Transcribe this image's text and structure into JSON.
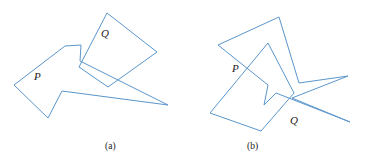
{
  "figure": {
    "background_color": "#ffffff",
    "stroke_color": "#5b96cc",
    "label_color": "#1a1a1a",
    "panels": [
      {
        "id": "a",
        "caption": "(a)",
        "caption_x": 105,
        "caption_y": 149,
        "shapes": [
          {
            "name": "polygon-p",
            "label": "P",
            "label_x": 34,
            "label_y": 80,
            "points": "14,85 65,46 81,45 80,61 168,105 62,91 48,118"
          },
          {
            "name": "polygon-q",
            "label": "Q",
            "label_x": 101,
            "label_y": 37,
            "points": "107,13 157,52 108,87 79,67"
          }
        ]
      },
      {
        "id": "b",
        "caption": "(b)",
        "caption_x": 247,
        "caption_y": 149,
        "shapes": [
          {
            "name": "polygon-p",
            "label": "P",
            "label_x": 232,
            "label_y": 72,
            "points": "279,17 299,83 348,76 292,98 350,122 276,93 264,105 268,85 218,45"
          },
          {
            "name": "polygon-q",
            "label": "Q",
            "label_x": 290,
            "label_y": 124,
            "points": "268,43 294,93 261,131 210,113"
          }
        ]
      }
    ]
  }
}
